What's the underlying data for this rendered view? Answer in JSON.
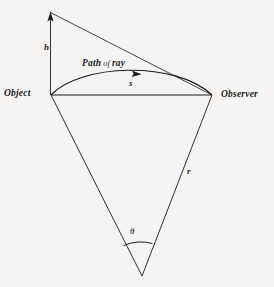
{
  "figure": {
    "background_color": "#f5f4f2",
    "ink_color": "#1b1b1b",
    "labels": {
      "object": "Object",
      "observer": "Observer",
      "height": "h",
      "arc_distance": "s",
      "radius": "r",
      "angle": "θ",
      "path_prefix": "Path",
      "path_of": "of",
      "path_suffix": "ray"
    },
    "geometry": {
      "apex": [
        50,
        12
      ],
      "object": [
        51,
        95
      ],
      "observer": [
        212,
        95
      ],
      "center": [
        142,
        276
      ],
      "ray_peak": [
        131,
        72
      ],
      "ray_arrow": [
        137,
        74
      ],
      "angle_arc_start": [
        124,
        245
      ],
      "angle_arc_end": [
        152,
        243
      ]
    }
  }
}
